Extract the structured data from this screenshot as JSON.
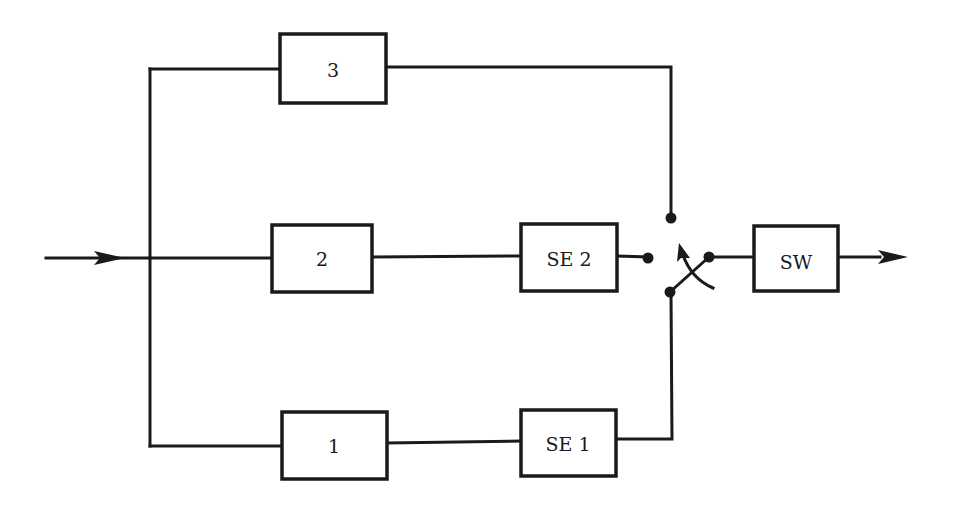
{
  "diagram": {
    "type": "block-diagram",
    "blocks": [
      {
        "id": "b3",
        "label": "3"
      },
      {
        "id": "b2",
        "label": "2"
      },
      {
        "id": "b1",
        "label": "1"
      },
      {
        "id": "se2",
        "label": "SE 2"
      },
      {
        "id": "se1",
        "label": "SE 1"
      },
      {
        "id": "sw",
        "label": "SW"
      }
    ],
    "connections": [
      {
        "from": "input",
        "to": "b3"
      },
      {
        "from": "input",
        "to": "b2"
      },
      {
        "from": "input",
        "to": "b1"
      },
      {
        "from": "b2",
        "to": "se2"
      },
      {
        "from": "b1",
        "to": "se1"
      },
      {
        "from": "b3",
        "to": "switch-contact-top"
      },
      {
        "from": "se2",
        "to": "switch-contact-left"
      },
      {
        "from": "se1",
        "to": "switch-contact-bottom"
      },
      {
        "from": "switch-pole",
        "to": "sw"
      },
      {
        "from": "sw",
        "to": "output"
      }
    ],
    "colors": {
      "ink": "#1a1a1a",
      "background": "#ffffff"
    }
  }
}
